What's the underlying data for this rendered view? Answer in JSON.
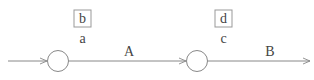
{
  "diagram": {
    "nodes": [
      {
        "id": "n1",
        "box_label": "b",
        "label": "a"
      },
      {
        "id": "n2",
        "box_label": "d",
        "label": "c"
      }
    ],
    "edges": [
      {
        "from": "start",
        "to": "n1",
        "label": ""
      },
      {
        "from": "n1",
        "to": "n2",
        "label": "A"
      },
      {
        "from": "n2",
        "to": "end",
        "label": "B"
      }
    ],
    "colors": {
      "stroke": "#888888",
      "text": "#444444"
    }
  }
}
